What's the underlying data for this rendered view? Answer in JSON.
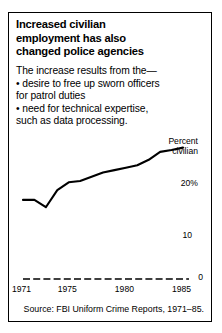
{
  "figure": {
    "title_lines": [
      "Increased civilian",
      "employment has also",
      "changed police agencies"
    ],
    "intro_lead": "The increase results from the—",
    "bullets": [
      "• desire to free up sworn officers",
      "for patrol duties",
      "• need for technical expertise,",
      "such as data processing."
    ],
    "source": "Source: FBI Uniform Crime Reports, 1971–85.",
    "line_color": "#000000",
    "border_color": "#000000"
  },
  "chart_data": {
    "type": "line",
    "title": "Increased civilian employment has also changed police agencies",
    "xlabel": "",
    "ylabel": "Percent civilian",
    "ylabel_lines": [
      "Percent",
      "civilian"
    ],
    "x": [
      1971,
      1972,
      1973,
      1974,
      1975,
      1976,
      1977,
      1978,
      1979,
      1980,
      1981,
      1982,
      1983,
      1984,
      1985
    ],
    "values": [
      13.0,
      13.0,
      11.8,
      14.6,
      15.9,
      16.1,
      16.8,
      17.5,
      17.9,
      18.3,
      18.7,
      19.6,
      20.9,
      21.2,
      21.6
    ],
    "series": [
      {
        "name": "Percent civilian",
        "values": [
          13.0,
          13.0,
          11.8,
          14.6,
          15.9,
          16.1,
          16.8,
          17.5,
          17.9,
          18.3,
          18.7,
          19.6,
          20.9,
          21.2,
          21.6
        ]
      }
    ],
    "xlim": [
      1971,
      1985
    ],
    "ylim": [
      0,
      24
    ],
    "xticks": [
      1971,
      1975,
      1980,
      1985
    ],
    "xticklabels": [
      "1971",
      "1975",
      "1980",
      "1985"
    ],
    "yticks": [
      0,
      10,
      20
    ],
    "yticklabels": [
      "0",
      "10",
      "20%"
    ],
    "grid": false,
    "legend": "none",
    "baseline_style": "dashed",
    "annotations": [
      "Percent civilian"
    ]
  }
}
